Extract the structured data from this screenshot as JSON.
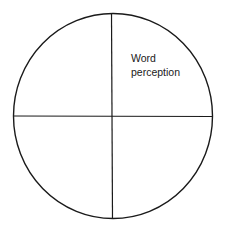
{
  "diagram": {
    "type": "circle-quadrants",
    "quadrants": {
      "top_right": {
        "label_line1": "Word",
        "label_line2": "perception"
      },
      "top_left": {
        "label_line1": "",
        "label_line2": ""
      },
      "bottom_left": {
        "label_line1": "",
        "label_line2": ""
      },
      "bottom_right": {
        "label_line1": "",
        "label_line2": ""
      }
    },
    "stroke_color": "#1a1a1a",
    "background_color": "#ffffff"
  }
}
